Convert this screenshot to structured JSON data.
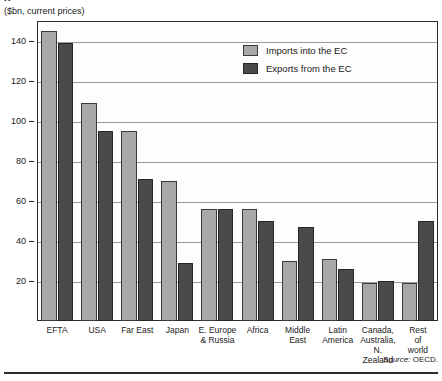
{
  "clipped_title": "g",
  "unit_caption": "($bn, current prices)",
  "source_prefix": "Source:",
  "source_value": "OECD.",
  "legend": {
    "imports_label": "Imports into the EC",
    "exports_label": "Exports from the EC"
  },
  "colors": {
    "imports": "#a8a8a8",
    "exports": "#4a4a4a",
    "frame": "#2b2b2b",
    "gridline": "#9a9a9a",
    "background": "#ffffff"
  },
  "chart_data": {
    "type": "bar",
    "title": "",
    "subtitle": "($bn, current prices)",
    "xlabel": "",
    "ylabel": "",
    "ylim": [
      0,
      150
    ],
    "yticks": [
      20,
      40,
      60,
      80,
      100,
      120,
      140
    ],
    "ytick_labels": [
      "20",
      "40",
      "60",
      "80",
      "100",
      "120",
      "140"
    ],
    "grid": true,
    "legend_position": "inside-top-right",
    "categories": [
      "EFTA",
      "USA",
      "Far East",
      "Japan",
      "E. Europe\n& Russia",
      "Africa",
      "Middle\nEast",
      "Latin\nAmerica",
      "Canada,\nAustralia,\nN. Zealand",
      "Rest\nof\nworld"
    ],
    "series": [
      {
        "name": "Imports into the EC",
        "color": "#a8a8a8",
        "values": [
          145,
          109,
          95,
          70,
          56,
          56,
          30,
          31,
          19,
          19
        ]
      },
      {
        "name": "Exports from the EC",
        "color": "#4a4a4a",
        "values": [
          139,
          95,
          71,
          29,
          56,
          50,
          47,
          26,
          20,
          50
        ]
      }
    ],
    "source": "Source: OECD."
  }
}
